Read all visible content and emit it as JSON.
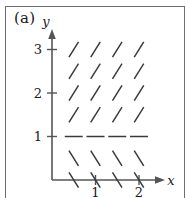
{
  "figure": {
    "panel_label": "(a)",
    "caption_kind": "slope-field"
  },
  "axes": {
    "x_label": "x",
    "y_label": "y",
    "x_ticks": [
      {
        "value": 1,
        "label": "1"
      },
      {
        "value": 2,
        "label": "2"
      }
    ],
    "y_ticks": [
      {
        "value": 1,
        "label": "1"
      },
      {
        "value": 2,
        "label": "2"
      },
      {
        "value": 3,
        "label": "3"
      }
    ],
    "x_range": [
      0,
      2.6
    ],
    "y_range": [
      0,
      3.3
    ],
    "origin_label": ""
  },
  "colors": {
    "axis": "#555555",
    "mark": "#3a3a3a",
    "frame": "#6e6e6e",
    "text": "#1a1a1a",
    "background": "#ffffff"
  },
  "chart_data": {
    "type": "scatter",
    "title": "",
    "subtitle": "",
    "xlabel": "x",
    "ylabel": "y",
    "xlim": [
      0,
      2.6
    ],
    "ylim": [
      0,
      3.3
    ],
    "grid": false,
    "legend": "none",
    "x_grid_points": [
      0.5,
      1.0,
      1.5,
      2.0
    ],
    "y_grid_points": [
      0.0,
      0.5,
      1.0,
      1.5,
      2.0,
      2.5,
      3.0
    ],
    "marks": [
      {
        "x": 0.5,
        "y": 3.0,
        "slope": 1.6
      },
      {
        "x": 1.0,
        "y": 3.0,
        "slope": 1.6
      },
      {
        "x": 1.5,
        "y": 3.0,
        "slope": 1.6
      },
      {
        "x": 2.0,
        "y": 3.0,
        "slope": 1.6
      },
      {
        "x": 0.5,
        "y": 2.5,
        "slope": 1.6
      },
      {
        "x": 1.0,
        "y": 2.5,
        "slope": 1.6
      },
      {
        "x": 1.5,
        "y": 2.5,
        "slope": 1.6
      },
      {
        "x": 2.0,
        "y": 2.5,
        "slope": 1.6
      },
      {
        "x": 0.5,
        "y": 2.0,
        "slope": 1.6
      },
      {
        "x": 1.0,
        "y": 2.0,
        "slope": 1.6
      },
      {
        "x": 1.5,
        "y": 2.0,
        "slope": 1.6
      },
      {
        "x": 2.0,
        "y": 2.0,
        "slope": 1.6
      },
      {
        "x": 0.5,
        "y": 1.5,
        "slope": 1.6
      },
      {
        "x": 1.0,
        "y": 1.5,
        "slope": 1.6
      },
      {
        "x": 1.5,
        "y": 1.5,
        "slope": 1.6
      },
      {
        "x": 2.0,
        "y": 1.5,
        "slope": 1.6
      },
      {
        "x": 0.5,
        "y": 1.0,
        "slope": 0.0
      },
      {
        "x": 1.0,
        "y": 1.0,
        "slope": 0.0
      },
      {
        "x": 1.5,
        "y": 1.0,
        "slope": 0.0
      },
      {
        "x": 2.0,
        "y": 1.0,
        "slope": 0.0
      },
      {
        "x": 0.5,
        "y": 0.5,
        "slope": -1.6
      },
      {
        "x": 1.0,
        "y": 0.5,
        "slope": -1.6
      },
      {
        "x": 1.5,
        "y": 0.5,
        "slope": -1.6
      },
      {
        "x": 2.0,
        "y": 0.5,
        "slope": -1.6
      },
      {
        "x": 0.5,
        "y": 0.0,
        "slope": -1.6
      },
      {
        "x": 1.0,
        "y": 0.0,
        "slope": -1.6
      },
      {
        "x": 1.5,
        "y": 0.0,
        "slope": -1.6
      },
      {
        "x": 2.0,
        "y": 0.0,
        "slope": -1.6
      }
    ]
  }
}
